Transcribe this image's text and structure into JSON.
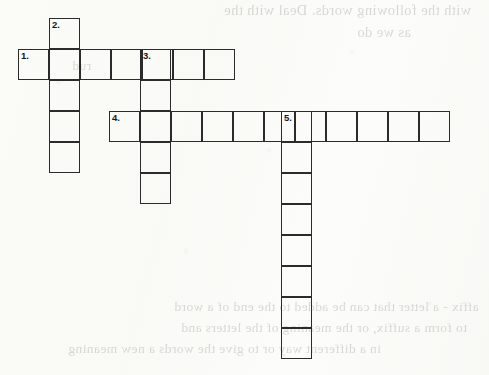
{
  "page": {
    "type": "crossword-puzzle-worksheet",
    "background_color": "#fdfdfb",
    "ink_color": "#2b2b2b",
    "width": 489,
    "height": 375
  },
  "bleed_through_text": {
    "note": "Faint mirrored text showing through from the reverse side of the worksheet page",
    "top": [
      "with the following words. Deal with the",
      "as we do",
      "rud"
    ],
    "bottom": [
      "affix - a letter that can be added to the end of a word",
      "to form a suffix, or the meaning of the letters and",
      "in a different way or to give the words a new meaning"
    ]
  },
  "grid": {
    "cell_size": 31,
    "border_width": 1.7,
    "entries": [
      {
        "number": "1.",
        "direction": "across",
        "length": 7,
        "start_x": 18,
        "start_y": 49
      },
      {
        "number": "2.",
        "direction": "down",
        "length": 5,
        "start_x": 49,
        "start_y": 18
      },
      {
        "number": "3.",
        "direction": "down",
        "length": 5,
        "start_x": 140,
        "start_y": 49
      },
      {
        "number": "4.",
        "direction": "across",
        "length": 11,
        "start_x": 109,
        "start_y": 111
      },
      {
        "number": "5.",
        "direction": "down",
        "length": 8,
        "start_x": 281,
        "start_y": 111
      }
    ]
  },
  "clue_numbers": {
    "one": "1.",
    "two": "2.",
    "three": "3.",
    "four": "4.",
    "five": "5."
  }
}
